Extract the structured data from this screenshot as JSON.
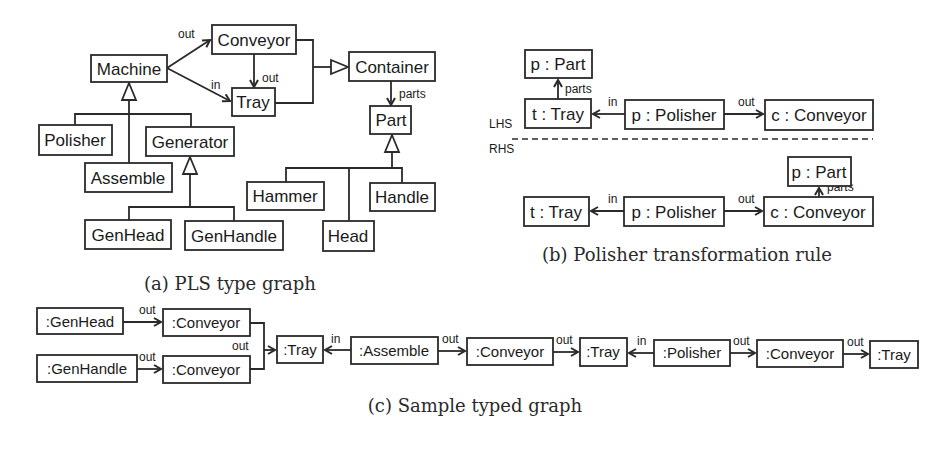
{
  "panel_a": {
    "caption": "(a) PLS type graph",
    "nodes": {
      "conveyor": "Conveyor",
      "machine": "Machine",
      "tray": "Tray",
      "container": "Container",
      "part": "Part",
      "polisher": "Polisher",
      "generator": "Generator",
      "assemble": "Assemble",
      "hammer": "Hammer",
      "handle": "Handle",
      "genhead": "GenHead",
      "genhandle": "GenHandle",
      "head": "Head"
    },
    "edges": {
      "machine_conveyor": "out",
      "machine_tray": "in",
      "conveyor_tray": "out",
      "container_part": "parts"
    }
  },
  "panel_b": {
    "caption": "(b) Polisher transformation rule",
    "lhs_label": "LHS",
    "rhs_label": "RHS",
    "lhs": {
      "part": "p : Part",
      "tray": "t : Tray",
      "polisher": "p : Polisher",
      "conveyor": "c : Conveyor",
      "edge_parts": "parts",
      "edge_in": "in",
      "edge_out": "out"
    },
    "rhs": {
      "part": "p : Part",
      "tray": "t : Tray",
      "polisher": "p : Polisher",
      "conveyor": "c : Conveyor",
      "edge_parts": "parts",
      "edge_in": "in",
      "edge_out": "out"
    }
  },
  "panel_c": {
    "caption": "(c) Sample typed graph",
    "nodes": {
      "genhead": ":GenHead",
      "conveyor1": ":Conveyor",
      "genhandle": ":GenHandle",
      "conveyor2": ":Conveyor",
      "tray1": ":Tray",
      "assemble": ":Assemble",
      "conveyor3": ":Conveyor",
      "tray2": ":Tray",
      "polisher": ":Polisher",
      "conveyor4": ":Conveyor",
      "tray3": ":Tray"
    },
    "edges": {
      "e1": "out",
      "e2": "out",
      "e3": "out",
      "e4": "in",
      "e5": "out",
      "e6": "in",
      "e7": "out",
      "e8": "out"
    }
  }
}
